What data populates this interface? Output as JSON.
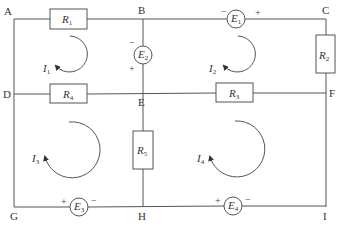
{
  "diagram": {
    "type": "electrical circuit",
    "nodes": [
      {
        "id": "A",
        "label": "A"
      },
      {
        "id": "B",
        "label": "B"
      },
      {
        "id": "C",
        "label": "C"
      },
      {
        "id": "D",
        "label": "D"
      },
      {
        "id": "E",
        "label": "E"
      },
      {
        "id": "F",
        "label": "F"
      },
      {
        "id": "G",
        "label": "G"
      },
      {
        "id": "H",
        "label": "H"
      },
      {
        "id": "I",
        "label": "I"
      }
    ],
    "resistors": [
      {
        "id": "R1",
        "letter": "R",
        "sub": "1",
        "between": [
          "A",
          "B"
        ]
      },
      {
        "id": "R2",
        "letter": "R",
        "sub": "2",
        "between": [
          "C",
          "F"
        ]
      },
      {
        "id": "R3",
        "letter": "R",
        "sub": "3",
        "between": [
          "E",
          "F"
        ]
      },
      {
        "id": "R4",
        "letter": "R",
        "sub": "4",
        "between": [
          "D",
          "E"
        ]
      },
      {
        "id": "R5",
        "letter": "R",
        "sub": "5",
        "between": [
          "E",
          "H"
        ]
      }
    ],
    "sources": [
      {
        "id": "E1",
        "letter": "E",
        "sub": "1",
        "between": [
          "B",
          "C"
        ],
        "neg": "−",
        "pos": "+"
      },
      {
        "id": "E2",
        "letter": "E",
        "sub": "2",
        "between": [
          "B",
          "E"
        ],
        "neg": "−",
        "pos": "+"
      },
      {
        "id": "E3",
        "letter": "E",
        "sub": "3",
        "between": [
          "G",
          "H"
        ],
        "neg": "−",
        "pos": "+"
      },
      {
        "id": "E4",
        "letter": "E",
        "sub": "4",
        "between": [
          "H",
          "I"
        ],
        "neg": "−",
        "pos": "+"
      }
    ],
    "loop_currents": [
      {
        "id": "I1",
        "letter": "I",
        "sub": "1",
        "direction": "clockwise"
      },
      {
        "id": "I2",
        "letter": "I",
        "sub": "2",
        "direction": "clockwise"
      },
      {
        "id": "I3",
        "letter": "I",
        "sub": "3",
        "direction": "clockwise"
      },
      {
        "id": "I4",
        "letter": "I",
        "sub": "4",
        "direction": "clockwise"
      }
    ],
    "colors": {
      "line": "#555555",
      "text": "#333333",
      "background": "#ffffff"
    }
  }
}
